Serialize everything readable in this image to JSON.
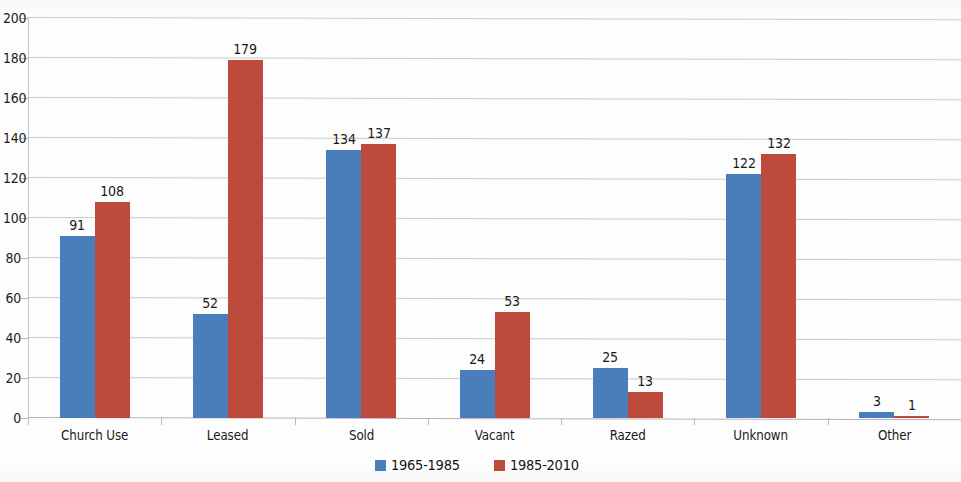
{
  "chart_data": {
    "type": "bar",
    "title": "",
    "subtitle": "",
    "xlabel": "",
    "ylabel": "",
    "ylim": [
      0,
      200
    ],
    "y_ticks": [
      0,
      20,
      40,
      60,
      80,
      100,
      120,
      140,
      160,
      180,
      200
    ],
    "grid": true,
    "legend_position": "bottom",
    "categories": [
      "Church Use",
      "Leased",
      "Sold",
      "Vacant",
      "Razed",
      "Unknown",
      "Other"
    ],
    "series": [
      {
        "name": "1965-1985",
        "color": "#4a7ebb",
        "values": [
          91,
          52,
          134,
          24,
          25,
          122,
          3
        ]
      },
      {
        "name": "1985-2010",
        "color": "#bd4b3c",
        "values": [
          108,
          179,
          137,
          53,
          13,
          132,
          1
        ]
      }
    ]
  }
}
